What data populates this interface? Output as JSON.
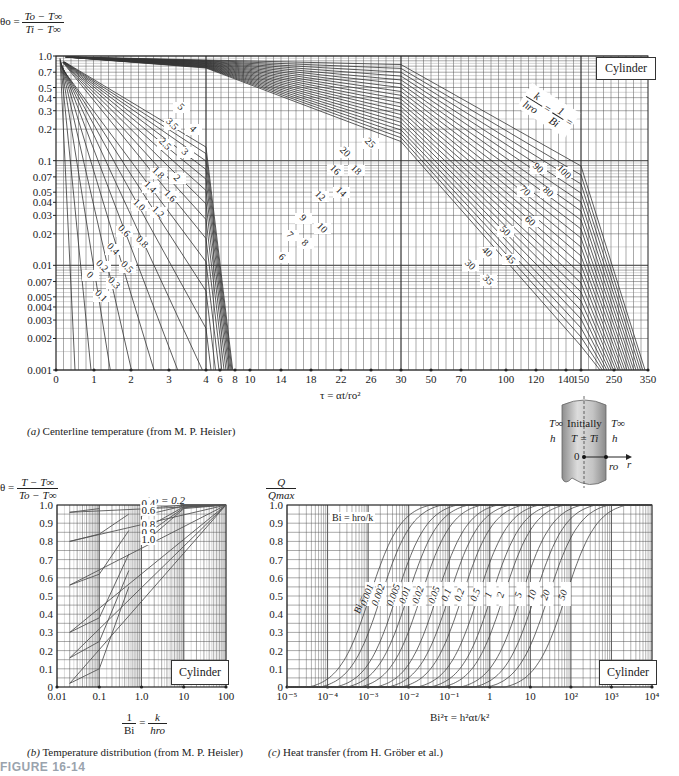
{
  "figure_label": "FIGURE 16-14",
  "chart_data": [
    {
      "id": "a",
      "type": "line",
      "title": "Centerline temperature (from M. P. Heisler)",
      "caption_prefix": "(a)",
      "ylabel_lhs": "θo =",
      "ylabel_num": "To − T∞",
      "ylabel_den": "Ti − T∞",
      "xlabel": "τ = αt/ro²",
      "y_scale": "log",
      "ylim": [
        0.001,
        1.0
      ],
      "y_ticks": [
        1.0,
        0.7,
        0.5,
        0.4,
        0.3,
        0.2,
        0.1,
        0.07,
        0.05,
        0.04,
        0.03,
        0.02,
        0.01,
        0.007,
        0.005,
        0.004,
        0.003,
        0.002,
        0.001
      ],
      "y_tick_labels": [
        "1.0",
        "0.7",
        "0.5",
        "0.4",
        "0.3",
        "0.2",
        "0.1",
        "0.07",
        "0.05",
        "0.04",
        "0.03",
        "0.02",
        "0.01",
        "0.007",
        "0.005",
        "0.004",
        "0.003",
        "0.002",
        "0.001"
      ],
      "x_segments": [
        {
          "range": [
            0,
            4
          ],
          "ticks": [
            "0",
            "1",
            "2",
            "3",
            "4"
          ]
        },
        {
          "range": [
            4,
            30
          ],
          "ticks": [
            "6",
            "8",
            "10",
            "14",
            "18",
            "22",
            "26",
            "30"
          ]
        },
        {
          "range": [
            30,
            150
          ],
          "ticks": [
            "50",
            "70",
            "100",
            "120",
            "140",
            "150"
          ]
        },
        {
          "range": [
            150,
            350
          ],
          "ticks": [
            "250",
            "350"
          ]
        }
      ],
      "x_tick_labels": [
        "0",
        "1",
        "2",
        "3",
        "4",
        "6",
        "8",
        "10",
        "14",
        "18",
        "22",
        "26",
        "30",
        "50",
        "70",
        "100",
        "120",
        "140",
        "150",
        "250",
        "350"
      ],
      "legend_box": "Cylinder",
      "curve_param_label": "k/hro = 1/Bi =",
      "curve_param_num1": "k",
      "curve_param_den1": "hro",
      "curve_param_num2": "1",
      "curve_param_den2": "Bi",
      "series_labels": [
        "0",
        "0.1",
        "0.2",
        "0.3",
        "0.4",
        "0.5",
        "0.6",
        "0.8",
        "1.0",
        "1.2",
        "1.4",
        "1.6",
        "1.8",
        "2",
        "2.5",
        "3",
        "3.5",
        "4",
        "5",
        "6",
        "7",
        "8",
        "9",
        "10",
        "12",
        "14",
        "16",
        "18",
        "20",
        "25",
        "30",
        "35",
        "40",
        "45",
        "50",
        "60",
        "70",
        "80",
        "90",
        "100"
      ]
    },
    {
      "id": "b",
      "type": "line",
      "title": "Temperature distribution (from M. P. Heisler)",
      "caption_prefix": "(b)",
      "ylabel_lhs": "θ =",
      "ylabel_num": "T − T∞",
      "ylabel_den": "To − T∞",
      "xlabel_num": "1",
      "xlabel_den": "Bi",
      "xlabel_eq": "=",
      "xlabel_num2": "k",
      "xlabel_den2": "hro",
      "x_scale": "log",
      "xlim": [
        0.01,
        100
      ],
      "x_ticks": [
        "0.01",
        "0.1",
        "1.0",
        "10",
        "100"
      ],
      "ylim": [
        0,
        1.0
      ],
      "y_ticks": [
        "1.0",
        "0.9",
        "0.8",
        "0.7",
        "0.6",
        "0.5",
        "0.4",
        "0.3",
        "0.2",
        "0.1",
        "0"
      ],
      "legend_box": "Cylinder",
      "series": [
        {
          "name": "r/ro = 0.2",
          "values": {
            "0.02": 0.96,
            "0.1": 0.98,
            "1": 0.997,
            "10": 1.0,
            "100": 1.0
          }
        },
        {
          "name": "0.4",
          "values": {
            "0.02": 0.8,
            "0.1": 0.84,
            "0.5": 0.95,
            "1": 0.98,
            "10": 1.0,
            "100": 1.0
          }
        },
        {
          "name": "0.6",
          "values": {
            "0.02": 0.56,
            "0.1": 0.62,
            "0.5": 0.86,
            "1": 0.94,
            "10": 0.995,
            "100": 1.0
          }
        },
        {
          "name": "0.8",
          "values": {
            "0.02": 0.3,
            "0.1": 0.38,
            "0.5": 0.73,
            "1": 0.86,
            "10": 0.99,
            "100": 1.0
          }
        },
        {
          "name": "0.9",
          "values": {
            "0.02": 0.16,
            "0.1": 0.25,
            "0.5": 0.64,
            "1": 0.82,
            "10": 0.985,
            "100": 1.0
          }
        },
        {
          "name": "1.0",
          "values": {
            "0.02": 0.02,
            "0.1": 0.1,
            "0.5": 0.55,
            "1": 0.78,
            "10": 0.98,
            "100": 1.0
          }
        }
      ]
    },
    {
      "id": "c",
      "type": "line",
      "title": "Heat transfer (from H. Gröber et al.)",
      "caption_prefix": "(c)",
      "ylabel_num": "Q",
      "ylabel_den": "Qmax",
      "xlabel": "Bi²τ = h²αt/k²",
      "x_scale": "log",
      "xlim": [
        1e-05,
        10000.0
      ],
      "x_ticks": [
        "10⁻⁵",
        "10⁻⁴",
        "10⁻³",
        "10⁻²",
        "10⁻¹",
        "1",
        "10",
        "10²",
        "10³",
        "10⁴"
      ],
      "ylim": [
        0,
        1.0
      ],
      "y_ticks": [
        "1.0",
        "0.9",
        "0.8",
        "0.7",
        "0.6",
        "0.5",
        "0.4",
        "0.3",
        "0.2",
        "0.1",
        "0"
      ],
      "legend_box": "Cylinder",
      "bi_note": "Bi = hro/k",
      "series_prefix": "Bi =",
      "series": [
        {
          "name": "0.001",
          "x_at_half": 0.0011
        },
        {
          "name": "0.002",
          "x_at_half": 0.0021
        },
        {
          "name": "0.005",
          "x_at_half": 0.005
        },
        {
          "name": "0.01",
          "x_at_half": 0.0095
        },
        {
          "name": "0.02",
          "x_at_half": 0.02
        },
        {
          "name": "0.05",
          "x_at_half": 0.05
        },
        {
          "name": "0.1",
          "x_at_half": 0.1
        },
        {
          "name": "0.2",
          "x_at_half": 0.21
        },
        {
          "name": "0.5",
          "x_at_half": 0.52
        },
        {
          "name": "1",
          "x_at_half": 1.1
        },
        {
          "name": "2",
          "x_at_half": 2.2
        },
        {
          "name": "5",
          "x_at_half": 6
        },
        {
          "name": "10",
          "x_at_half": 13
        },
        {
          "name": "20",
          "x_at_half": 28
        },
        {
          "name": "50",
          "x_at_half": 75
        }
      ]
    }
  ],
  "diagram": {
    "left_T": "T∞",
    "left_h": "h",
    "right_T": "T∞",
    "right_h": "h",
    "line1": "Initially",
    "line2": "T = Ti",
    "origin": "0",
    "radius": "ro",
    "axis": "r"
  }
}
